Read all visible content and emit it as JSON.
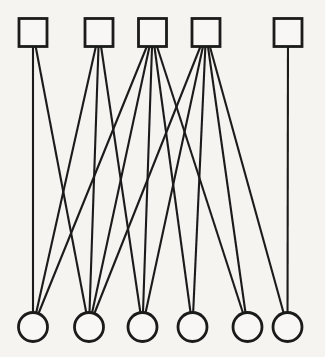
{
  "diagram": {
    "type": "bipartite-graph",
    "colors": {
      "background": "#f5f4f1",
      "stroke": "#1b1b1b",
      "node_fill": "#f8f7f5"
    },
    "style": {
      "node_stroke_width": 2.8,
      "edge_stroke_width": 2.1,
      "square_size": 28,
      "circle_radius": 14.5
    },
    "square_nodes": [
      {
        "id": "S1",
        "x": 33,
        "y": 32.5
      },
      {
        "id": "S2",
        "x": 99,
        "y": 32.5
      },
      {
        "id": "S3",
        "x": 152.5,
        "y": 32.5
      },
      {
        "id": "S4",
        "x": 206,
        "y": 32.5
      },
      {
        "id": "S5",
        "x": 288,
        "y": 32.5
      }
    ],
    "circle_nodes": [
      {
        "id": "C1",
        "x": 33,
        "y": 327
      },
      {
        "id": "C2",
        "x": 89,
        "y": 327
      },
      {
        "id": "C3",
        "x": 142.5,
        "y": 327
      },
      {
        "id": "C4",
        "x": 192.5,
        "y": 327
      },
      {
        "id": "C5",
        "x": 247.5,
        "y": 327
      },
      {
        "id": "C6",
        "x": 287.5,
        "y": 327
      }
    ],
    "edges": [
      [
        "S1",
        "C1"
      ],
      [
        "S1",
        "C2"
      ],
      [
        "S2",
        "C1"
      ],
      [
        "S2",
        "C2"
      ],
      [
        "S2",
        "C3"
      ],
      [
        "S3",
        "C1"
      ],
      [
        "S3",
        "C2"
      ],
      [
        "S3",
        "C3"
      ],
      [
        "S3",
        "C4"
      ],
      [
        "S3",
        "C5"
      ],
      [
        "S4",
        "C2"
      ],
      [
        "S4",
        "C3"
      ],
      [
        "S4",
        "C4"
      ],
      [
        "S4",
        "C5"
      ],
      [
        "S4",
        "C6"
      ],
      [
        "S5",
        "C6"
      ]
    ]
  }
}
